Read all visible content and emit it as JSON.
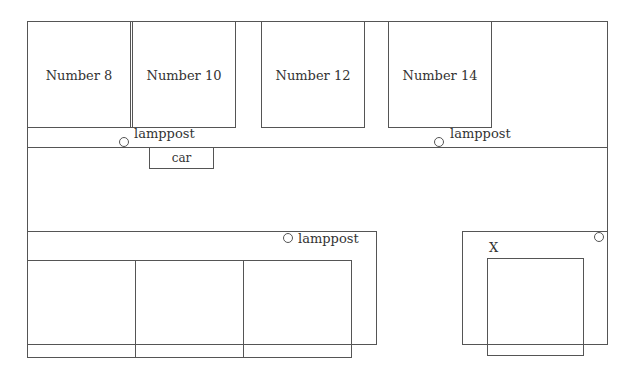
{
  "diagram": {
    "houses": [
      {
        "label": "Number 8"
      },
      {
        "label": "Number 10"
      },
      {
        "label": "Number 12"
      },
      {
        "label": "Number 14"
      }
    ],
    "lampposts": [
      {
        "label": "lamppost"
      },
      {
        "label": "lamppost"
      },
      {
        "label": "lamppost"
      }
    ],
    "car": {
      "label": "car"
    },
    "marker": {
      "label": "X"
    },
    "colors": {
      "line": "#555555",
      "background": "#ffffff",
      "text": "#333333"
    }
  }
}
